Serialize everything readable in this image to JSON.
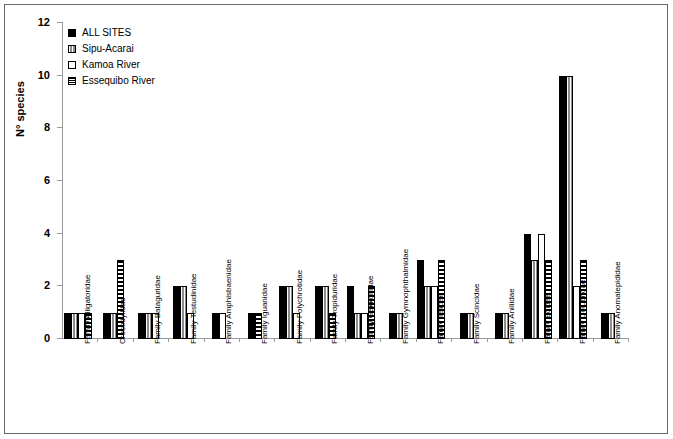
{
  "chart_data": {
    "type": "bar",
    "title": "",
    "subtitle": "",
    "xlabel": "",
    "ylabel": "N° species",
    "ylim": [
      0,
      12
    ],
    "yticks": [
      0,
      2,
      4,
      6,
      8,
      10,
      12
    ],
    "grid": false,
    "legend_position": "top-left",
    "categories": [
      "Family Alligatoridae",
      "Crocodylidae",
      "Family Bataguridae",
      "Family Testudinidae",
      "Family Amphisbaenidae",
      "Family Iguanidae",
      "Family Polychrotidae",
      "Family Tropiduridae",
      "Family Gekkonidae",
      "Family Gymnophthalmidae",
      "Family Teiidae",
      "Family Scincidae",
      "Family Aniliidae",
      "Family Boidae",
      "Family Colubridae",
      "Family Anomalepididae"
    ],
    "series": [
      {
        "name": "ALL SITES",
        "pattern": "solid-black",
        "values": [
          1,
          1,
          1,
          2,
          1,
          1,
          2,
          2,
          2,
          1,
          3,
          1,
          1,
          4,
          10,
          1
        ]
      },
      {
        "name": "Sipu-Acarai",
        "pattern": "grey-vertical-lines",
        "values": [
          1,
          1,
          1,
          2,
          0,
          0,
          2,
          2,
          1,
          1,
          2,
          1,
          1,
          3,
          10,
          1
        ]
      },
      {
        "name": "Kamoa River",
        "pattern": "white",
        "values": [
          1,
          0,
          1,
          1,
          1,
          0,
          1,
          0,
          1,
          0,
          2,
          0,
          0,
          4,
          2,
          0
        ]
      },
      {
        "name": "Essequibo River",
        "pattern": "horizontal-hatch",
        "values": [
          1,
          3,
          0,
          0,
          0,
          1,
          0,
          1,
          2,
          0,
          3,
          0,
          0,
          3,
          3,
          0
        ]
      }
    ]
  },
  "legend": {
    "items": [
      {
        "label": "ALL SITES"
      },
      {
        "label": "Sipu-Acarai"
      },
      {
        "label": "Kamoa River"
      },
      {
        "label": "Essequibo River"
      }
    ]
  },
  "colors": {
    "series_all_sites": "#000000",
    "series_sipu_acarai": "#8d8d8d",
    "series_kamoa_river": "#ffffff",
    "series_essequibo_river": "#000000",
    "axis": "#9a9a9a",
    "frame": "#6a6a6a",
    "background": "#ffffff"
  }
}
